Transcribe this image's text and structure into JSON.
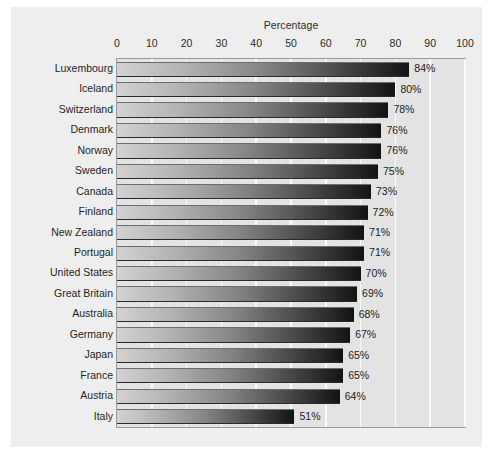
{
  "chart_data": {
    "type": "bar",
    "orientation": "horizontal",
    "title": "Percentage",
    "xlabel": "",
    "ylabel": "",
    "xlim": [
      0,
      100
    ],
    "xticks": [
      0,
      10,
      20,
      30,
      40,
      50,
      60,
      70,
      80,
      90,
      100
    ],
    "xtick_labels": [
      "0",
      "10",
      "20",
      "30",
      "40",
      "50",
      "60",
      "70",
      "80",
      "90",
      "100"
    ],
    "grid": true,
    "grid_axis": "x",
    "legend": false,
    "categories": [
      "Luxembourg",
      "Iceland",
      "Switzerland",
      "Denmark",
      "Norway",
      "Sweden",
      "Canada",
      "Finland",
      "New Zealand",
      "Portugal",
      "United States",
      "Great Britain",
      "Australia",
      "Germany",
      "Japan",
      "France",
      "Austria",
      "Italy"
    ],
    "values": [
      84,
      80,
      78,
      76,
      76,
      75,
      73,
      72,
      71,
      71,
      70,
      69,
      68,
      67,
      65,
      65,
      64,
      51
    ],
    "value_labels": [
      "84%",
      "80%",
      "78%",
      "76%",
      "76%",
      "75%",
      "73%",
      "72%",
      "71%",
      "71%",
      "70%",
      "69%",
      "68%",
      "67%",
      "65%",
      "65%",
      "64%",
      "51%"
    ]
  },
  "style": {
    "page_background": "#ffffff",
    "panel_background": "#eeeeee",
    "plot_background": "#e3e3e3",
    "plot_border": "#9a9a9a",
    "gridline_color": "#fbfbfb",
    "bar_gradient_start": "#d2d2d2",
    "bar_gradient_end": "#131313",
    "text_color": "#1f1f1f"
  }
}
